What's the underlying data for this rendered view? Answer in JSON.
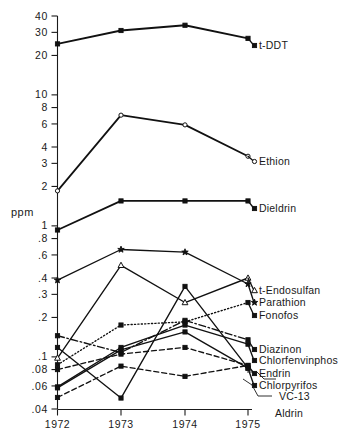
{
  "chart_data": {
    "type": "line",
    "title": "",
    "subtitle": "",
    "xlabel": "",
    "ylabel": "ppm",
    "yscale": "log",
    "grid": false,
    "legend_position": "right-inline",
    "categories": [
      "1972",
      "1973",
      "1974",
      "1975"
    ],
    "x": [
      1972,
      1973,
      1974,
      1975
    ],
    "ylim": [
      0.04,
      40
    ],
    "ytick_labels": [
      "40",
      "30",
      "20",
      "10",
      "8",
      "6",
      "4",
      "3",
      "2",
      "1",
      ".8",
      ".6",
      ".4",
      ".3",
      ".2",
      ".1",
      ".08",
      ".06",
      ".04"
    ],
    "ytick_values": [
      40,
      30,
      20,
      10,
      8,
      6,
      4,
      3,
      2,
      1,
      0.8,
      0.6,
      0.4,
      0.3,
      0.2,
      0.1,
      0.08,
      0.06,
      0.04
    ],
    "xtick_labels": [
      "1972",
      "1973",
      "1974",
      "1975"
    ],
    "series": [
      {
        "name": "t-DDT",
        "marker": "filled-square",
        "linestyle": "solid",
        "values": [
          24.5,
          31.0,
          34.0,
          27.0
        ]
      },
      {
        "name": "Ethion",
        "marker": "open-circle",
        "linestyle": "solid",
        "values": [
          1.85,
          7.0,
          5.9,
          3.4
        ]
      },
      {
        "name": "Dieldrin",
        "marker": "filled-square",
        "linestyle": "solid",
        "values": [
          0.93,
          1.55,
          1.55,
          1.55
        ]
      },
      {
        "name": "t-Endosulfan",
        "marker": "open-triangle",
        "linestyle": "solid",
        "values": [
          0.098,
          0.5,
          0.26,
          0.4
        ]
      },
      {
        "name": "Parathion",
        "marker": "filled-star",
        "linestyle": "solid",
        "values": [
          0.385,
          0.66,
          0.63,
          0.36
        ]
      },
      {
        "name": "Fonofos",
        "marker": "filled-square",
        "linestyle": "dotted",
        "values": [
          0.087,
          0.175,
          0.185,
          0.26
        ]
      },
      {
        "name": "Diazinon",
        "marker": "filled-square",
        "linestyle": "dashdot",
        "values": [
          0.145,
          0.108,
          0.19,
          0.135
        ]
      },
      {
        "name": "Chlorfenvinphos",
        "marker": "filled-square",
        "linestyle": "solid",
        "values": [
          0.059,
          0.118,
          0.175,
          0.125
        ]
      },
      {
        "name": "Endrin",
        "marker": "filled-square",
        "linestyle": "dashed",
        "values": [
          0.08,
          0.105,
          0.118,
          0.086
        ]
      },
      {
        "name": "Chlorpyrifos",
        "marker": "filled-square",
        "linestyle": "solid",
        "values": [
          0.058,
          0.113,
          0.155,
          0.082
        ]
      },
      {
        "name": "VC-13",
        "marker": "filled-square",
        "linestyle": "dashed",
        "values": [
          0.049,
          0.085,
          0.071,
          0.086
        ]
      },
      {
        "name": "Aldrin",
        "marker": "filled-square",
        "linestyle": "solid",
        "values": [
          0.118,
          0.0485,
          0.345,
          0.082
        ]
      }
    ],
    "annotations": [
      {
        "text": "t-DDT",
        "x": 1975,
        "y": 27.0
      },
      {
        "text": "Ethion",
        "x": 1975,
        "y": 3.4
      },
      {
        "text": "Dieldrin",
        "x": 1975,
        "y": 1.55
      },
      {
        "text": "t-Endosulfan",
        "x": 1975,
        "y": 0.4
      },
      {
        "text": "Parathion",
        "x": 1975,
        "y": 0.36
      },
      {
        "text": "Fonofos",
        "x": 1975,
        "y": 0.26
      },
      {
        "text": "Diazinon",
        "x": 1975,
        "y": 0.135
      },
      {
        "text": "Chlorfenvinphos",
        "x": 1975,
        "y": 0.125
      },
      {
        "text": "Endrin",
        "x": 1975,
        "y": 0.086
      },
      {
        "text": "Chlorpyrifos",
        "x": 1975,
        "y": 0.082
      },
      {
        "text": "VC-13",
        "x": 1975,
        "y": 0.086
      },
      {
        "text": "Aldrin",
        "x": 1975,
        "y": 0.082
      }
    ]
  },
  "axis": {
    "ylabel": "ppm",
    "yticks": [
      {
        "label": "40"
      },
      {
        "label": "30"
      },
      {
        "label": "20"
      },
      {
        "label": "10"
      },
      {
        "label": "8"
      },
      {
        "label": "6"
      },
      {
        "label": "4"
      },
      {
        "label": "3"
      },
      {
        "label": "2"
      },
      {
        "label": "1"
      },
      {
        "label": ".8"
      },
      {
        "label": ".6"
      },
      {
        "label": ".4"
      },
      {
        "label": ".3"
      },
      {
        "label": ".2"
      },
      {
        "label": ".1"
      },
      {
        "label": ".08"
      },
      {
        "label": ".06"
      },
      {
        "label": ".04"
      }
    ],
    "xticks": [
      {
        "label": "1972"
      },
      {
        "label": "1973"
      },
      {
        "label": "1974"
      },
      {
        "label": "1975"
      }
    ]
  },
  "labels": {
    "s0": "t-DDT",
    "s1": "Ethion",
    "s2": "Dieldrin",
    "s3": "t-Endosulfan",
    "s4": "Parathion",
    "s5": "Fonofos",
    "s6": "Diazinon",
    "s7": "Chlorfenvinphos",
    "s8": "Endrin",
    "s9": "Chlorpyrifos",
    "s10": "VC-13",
    "s11": "Aldrin"
  },
  "colors": {
    "ink": "#111111",
    "background": "#ffffff"
  }
}
